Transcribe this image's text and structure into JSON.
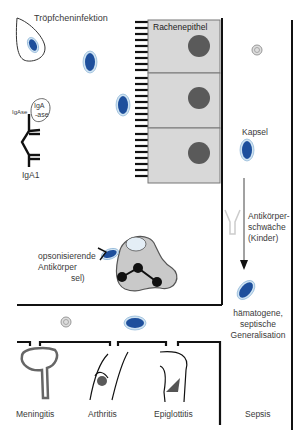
{
  "figure": {
    "labels": {
      "droplet_infection": "Tröpfcheninfektion",
      "pharyngeal_epithelium": "Rachenepithel",
      "igase_label": "IgAse",
      "iga_ase_1": "IgA",
      "iga_ase_2": "-ase",
      "iga1": "IgA1",
      "capsule": "Kapsel",
      "antibody_deficiency_1": "Antikörper-",
      "antibody_deficiency_2": "schwäche",
      "antibody_deficiency_3": "(Kinder)",
      "opsonizing_1": "opsonisierende",
      "opsonizing_2": "Antikörper",
      "opsonizing_3": "sel)",
      "hematogenous_1": "hämatogene,",
      "hematogenous_2": "septische",
      "hematogenous_3": "Generalisation"
    },
    "outcomes": [
      {
        "label": "Meningitis"
      },
      {
        "label": "Arthritis"
      },
      {
        "label": "Epiglottitis"
      },
      {
        "label": "Sepsis"
      }
    ],
    "colors": {
      "bacterium": "#1e4f9c",
      "capsule": "#cfe3f2",
      "cell_fill": "#d8d8d8",
      "nucleus": "#5a5a5a",
      "line": "#111111"
    }
  }
}
